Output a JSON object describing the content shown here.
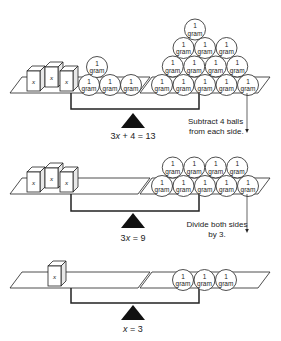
{
  "diagram": {
    "ball_label_top": "1",
    "ball_label_bottom": "gram",
    "box_label": "x",
    "colors": {
      "line": "#222222",
      "fill": "#ffffff",
      "fulcrum": "#111111",
      "text": "#222222"
    },
    "stages": [
      {
        "equation_parts": [
          "3",
          "x",
          " + 4 = 13"
        ],
        "equation": "3x + 4 = 13",
        "left": {
          "x_boxes": 3,
          "balls": 4
        },
        "right": {
          "balls": 13
        }
      },
      {
        "equation_parts": [
          "3",
          "x",
          " = 9"
        ],
        "equation": "3x = 9",
        "left": {
          "x_boxes": 3,
          "balls": 0
        },
        "right": {
          "balls": 9
        }
      },
      {
        "equation_parts": [
          "",
          "x",
          " = 3"
        ],
        "equation": "x = 3",
        "left": {
          "x_boxes": 1,
          "balls": 0
        },
        "right": {
          "balls": 3
        }
      }
    ],
    "steps": [
      {
        "line1": "Subtract 4 balls",
        "line2": "from each side."
      },
      {
        "line1": "Divide both sides",
        "line2": "by 3."
      }
    ]
  }
}
